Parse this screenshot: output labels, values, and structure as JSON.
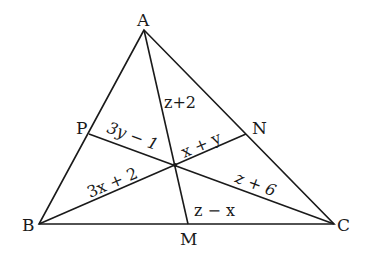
{
  "diagram": {
    "type": "triangle-medians",
    "vertices": {
      "A": {
        "label": "A",
        "x": 144,
        "y": 30
      },
      "B": {
        "label": "B",
        "x": 39,
        "y": 224
      },
      "C": {
        "label": "C",
        "x": 334,
        "y": 224
      }
    },
    "midpoints": {
      "P": {
        "label": "P",
        "x": 89,
        "y": 134
      },
      "N": {
        "label": "N",
        "x": 246,
        "y": 134
      },
      "M": {
        "label": "M",
        "x": 188,
        "y": 224
      }
    },
    "centroid": {
      "x": 175,
      "y": 165
    },
    "segment_labels": {
      "AO": "z+2",
      "PO": "3y − 1",
      "NO": "x + y",
      "BO": "3x + 2",
      "CO": "z + 6",
      "MO": "z − x"
    },
    "colors": {
      "stroke": "#1a1a1a",
      "background": "#ffffff"
    }
  }
}
